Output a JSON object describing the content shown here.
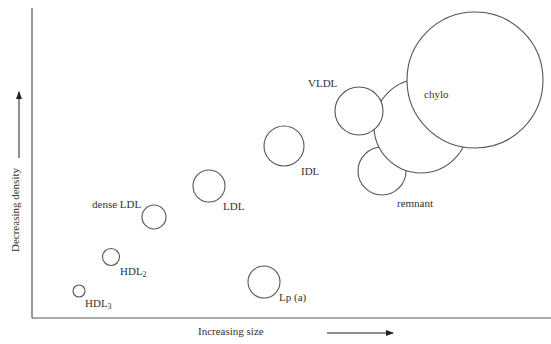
{
  "diagram": {
    "type": "bubble-scatter",
    "x_axis_label": "Increasing size",
    "y_axis_label": "Decreasing density",
    "particles": [
      {
        "name": "HDL",
        "sub": "3",
        "cx": 79,
        "cy": 291,
        "r": 6
      },
      {
        "name": "HDL",
        "sub": "2",
        "cx": 111,
        "cy": 257,
        "r": 8.5
      },
      {
        "name": "dense LDL",
        "sub": "",
        "cx": 154,
        "cy": 217,
        "r": 12
      },
      {
        "name": "LDL",
        "sub": "",
        "cx": 209,
        "cy": 186,
        "r": 16
      },
      {
        "name": "Lp (a)",
        "sub": "",
        "cx": 264,
        "cy": 282,
        "r": 16
      },
      {
        "name": "IDL",
        "sub": "",
        "cx": 284,
        "cy": 146,
        "r": 20
      },
      {
        "name": "remnant",
        "sub": "",
        "cx": 382,
        "cy": 171,
        "r": 24
      },
      {
        "name": "",
        "sub": "",
        "cx": 421,
        "cy": 126,
        "r": 47
      },
      {
        "name": "VLDL",
        "sub": "",
        "cx": 359,
        "cy": 111,
        "r": 24
      },
      {
        "name": "chylo",
        "sub": "",
        "cx": 475,
        "cy": 80,
        "r": 68
      }
    ]
  },
  "labels": {
    "hdl3": "HDL",
    "hdl3_sub": "3",
    "hdl2": "HDL",
    "hdl2_sub": "2",
    "dense_ldl": "dense LDL",
    "ldl": "LDL",
    "lpa": "Lp (a)",
    "idl": "IDL",
    "vldl": "VLDL",
    "chylo": "chylo",
    "remnant": "remnant"
  }
}
